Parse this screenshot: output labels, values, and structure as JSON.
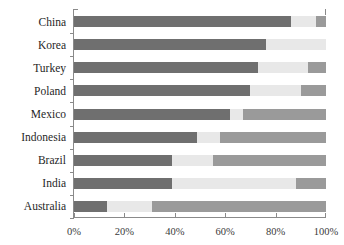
{
  "chart_data": {
    "type": "bar",
    "orientation": "horizontal",
    "stacked": true,
    "stacked_normalized": true,
    "title": "",
    "xlabel": "",
    "ylabel": "",
    "xlim": [
      0,
      100
    ],
    "xticks": [
      0,
      20,
      40,
      60,
      80,
      100
    ],
    "xtick_labels": [
      "0%",
      "20%",
      "40%",
      "60%",
      "80%",
      "100%"
    ],
    "grid": false,
    "legend": "none",
    "categories": [
      "China",
      "Korea",
      "Turkey",
      "Poland",
      "Mexico",
      "Indonesia",
      "Brazil",
      "India",
      "Australia"
    ],
    "series": [
      {
        "name": "segment-1",
        "color": "#6f6f6f",
        "values": [
          86,
          76,
          73,
          70,
          62,
          49,
          39,
          39,
          13
        ]
      },
      {
        "name": "segment-2",
        "color": "#e8e8e8",
        "values": [
          10,
          24,
          20,
          20,
          5,
          9,
          16,
          49,
          18
        ]
      },
      {
        "name": "segment-3",
        "color": "#9a9a9a",
        "values": [
          4,
          0,
          7,
          10,
          33,
          42,
          45,
          12,
          69
        ]
      }
    ]
  },
  "axis": {
    "tick_color": "#8a8a8a",
    "label_color": "#3a3a3a"
  }
}
